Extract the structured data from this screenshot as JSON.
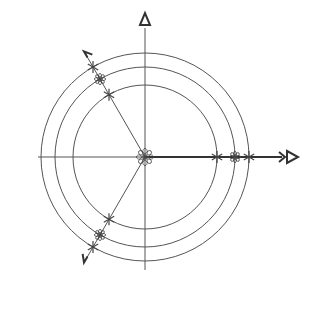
{
  "diagram": {
    "title": "",
    "colors": {
      "background": "#ffffff",
      "stroke": "#555555",
      "marker": "#444444"
    },
    "center": {
      "x": 145,
      "y": 157
    },
    "circle_radii": [
      72,
      90,
      104
    ],
    "axes": {
      "vertical_top_marker": "triangle-up",
      "horizontal_right_marker": "double-arrow-triangle-right"
    },
    "rays": [
      {
        "name": "ray-0deg",
        "angle": 0,
        "markers": [
          "star",
          "flower",
          "star"
        ]
      },
      {
        "name": "ray-120deg",
        "angle": 120,
        "markers": [
          "star",
          "flower",
          "star"
        ]
      },
      {
        "name": "ray-240deg",
        "angle": 240,
        "markers": [
          "star",
          "flower",
          "star"
        ]
      }
    ],
    "origin_marker": "flower"
  }
}
